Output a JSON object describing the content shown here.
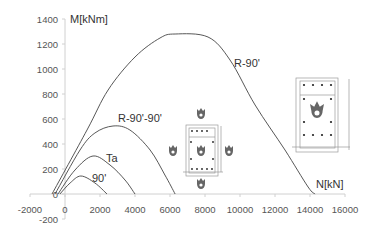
{
  "chart_data": {
    "type": "line",
    "title": "",
    "xlabel": "N[kN]",
    "ylabel": "M[kNm]",
    "xlim": [
      -2000,
      16000
    ],
    "ylim": [
      -200,
      1400
    ],
    "x_ticks": [
      -2000,
      0,
      2000,
      4000,
      6000,
      8000,
      10000,
      12000,
      14000,
      16000
    ],
    "y_ticks": [
      -200,
      0,
      200,
      400,
      600,
      800,
      1000,
      1200,
      1400
    ],
    "grid": false,
    "legend": "inline labels",
    "series": [
      {
        "name": "R-90'",
        "points": [
          [
            -740,
            0
          ],
          [
            1260,
            512
          ],
          [
            2460,
            832
          ],
          [
            4000,
            1096
          ],
          [
            5430,
            1248
          ],
          [
            6290,
            1280
          ],
          [
            8170,
            1256
          ],
          [
            9430,
            1072
          ],
          [
            10860,
            712
          ],
          [
            12570,
            352
          ],
          [
            13890,
            56
          ],
          [
            14290,
            0
          ]
        ],
        "label_pos": [
          235,
          63
        ]
      },
      {
        "name": "R-90'-90'",
        "points": [
          [
            -570,
            0
          ],
          [
            860,
            352
          ],
          [
            1710,
            488
          ],
          [
            2740,
            544
          ],
          [
            3710,
            512
          ],
          [
            4860,
            352
          ],
          [
            5710,
            152
          ],
          [
            6290,
            0
          ]
        ],
        "label_pos": [
          118,
          122
        ]
      },
      {
        "name": "Ta",
        "points": [
          [
            -400,
            0
          ],
          [
            570,
            192
          ],
          [
            1600,
            304
          ],
          [
            2570,
            232
          ],
          [
            3430,
            112
          ],
          [
            4000,
            0
          ]
        ],
        "label_pos": [
          105,
          160
        ]
      },
      {
        "name": "90'",
        "points": [
          [
            -290,
            0
          ],
          [
            290,
            88
          ],
          [
            910,
            144
          ],
          [
            1710,
            88
          ],
          [
            2400,
            0
          ]
        ],
        "label_pos": [
          92,
          180
        ]
      }
    ],
    "annotations": [
      "Cross-section diagram with reinforcement bars, fire exposure on four sides (small inset, center)",
      "Cross-section diagram with reinforcement bars, internal fire symbol (inset, right)"
    ]
  },
  "axes": {
    "x_title": "N[kN]",
    "y_title": "M[kNm]",
    "x_tick_labels": [
      "-2000",
      "0",
      "2000",
      "4000",
      "6000",
      "8000",
      "10000",
      "12000",
      "14000",
      "16000"
    ],
    "y_tick_labels": [
      "-200",
      "0",
      "200",
      "400",
      "600",
      "800",
      "1000",
      "1200",
      "1400"
    ]
  },
  "labels": {
    "r90": "R-90'",
    "r9090": "R-90'-90'",
    "ta": "Ta",
    "n90": "90'"
  },
  "insets": {
    "small": {
      "icon": "fire-icon",
      "exposure": "four-sided"
    },
    "large": {
      "icon": "fire-icon",
      "exposure": "internal"
    }
  },
  "colors": {
    "curve": "#444444",
    "axis": "#d0d0d0",
    "text": "#555555"
  }
}
